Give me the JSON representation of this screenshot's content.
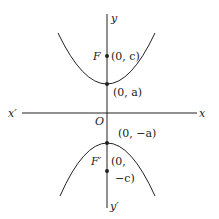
{
  "diagram": {
    "type": "hyperbola-vertical",
    "axes": {
      "x_pos": "x",
      "x_neg": "x′",
      "y_pos": "y",
      "y_neg": "y′",
      "origin": "O"
    },
    "upper_branch": {
      "focus_label": "F",
      "focus_coord": "(0, c)",
      "vertex_coord": "(0, a)"
    },
    "lower_branch": {
      "focus_label": "F′",
      "focus_coord_line1": "(0,",
      "focus_coord_line2": "−c)",
      "vertex_coord": "(0, −a)"
    },
    "colors": {
      "stroke": "#222222",
      "background": "#ffffff"
    }
  }
}
